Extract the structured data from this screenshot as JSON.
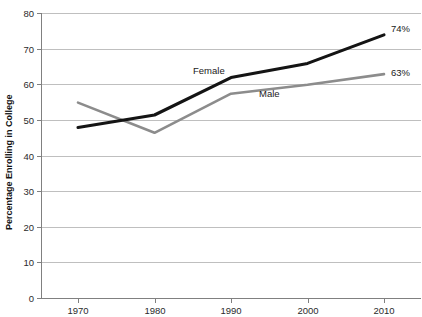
{
  "chart_data": {
    "type": "line",
    "title": "",
    "xlabel": "",
    "ylabel": "Percentage Enrolling in College",
    "categories": [
      "1970",
      "1980",
      "1990",
      "2000",
      "2010"
    ],
    "x": [
      1970,
      1980,
      1990,
      2000,
      2010
    ],
    "xlim": [
      1965,
      2015
    ],
    "ylim": [
      0,
      80
    ],
    "y_ticks": [
      "0",
      "10",
      "20",
      "30",
      "40",
      "50",
      "60",
      "70",
      "80"
    ],
    "y_tick_values": [
      0,
      10,
      20,
      30,
      40,
      50,
      60,
      70,
      80
    ],
    "grid": true,
    "legend_position": "inline-annotations",
    "series": [
      {
        "name": "Female",
        "color": "#141414",
        "values": [
          48,
          51.5,
          62,
          66,
          74
        ],
        "end_label": "74%",
        "inline_label": "Female"
      },
      {
        "name": "Male",
        "color": "#8c8c8c",
        "values": [
          55,
          46.5,
          57.5,
          60,
          63
        ],
        "end_label": "63%",
        "inline_label": "Male"
      }
    ],
    "annotations": [
      {
        "text": "Female",
        "series": "Female"
      },
      {
        "text": "Male",
        "series": "Male"
      },
      {
        "text": "74%",
        "series": "Female"
      },
      {
        "text": "63%",
        "series": "Male"
      }
    ]
  }
}
